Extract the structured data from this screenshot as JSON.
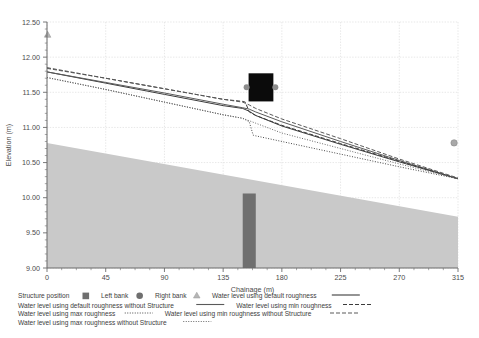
{
  "chart_data": {
    "type": "line",
    "title": "",
    "xlabel": "Chainage (m)",
    "ylabel": "Elevation (m)",
    "xlim": [
      0,
      315
    ],
    "ylim": [
      9.0,
      12.5
    ],
    "xticks": [
      0,
      45,
      90,
      135,
      180,
      225,
      270,
      315
    ],
    "yticks": [
      9.0,
      9.5,
      10.0,
      10.5,
      11.0,
      11.5,
      12.0,
      12.5
    ],
    "xtick_labels": [
      "0",
      "45",
      "90",
      "135",
      "180",
      "225",
      "270",
      "315"
    ],
    "ytick_labels": [
      "9.00",
      "9.50",
      "10.00",
      "10.50",
      "11.00",
      "11.50",
      "12.00",
      "12.50"
    ],
    "grid": true,
    "legend_position": "below-axes",
    "series": [
      {
        "name": "Water level using default roughness",
        "style": "solid",
        "color": "#3c3c3c",
        "x": [
          0,
          45,
          90,
          135,
          150,
          155,
          160,
          180,
          225,
          270,
          315
        ],
        "y": [
          11.79,
          11.63,
          11.47,
          11.31,
          11.27,
          11.23,
          11.17,
          11.02,
          10.76,
          10.51,
          10.27
        ]
      },
      {
        "name": "Water level using default roughness without Structure",
        "style": "solid",
        "color": "#5a5a5a",
        "x": [
          0,
          45,
          90,
          135,
          150,
          155,
          160,
          180,
          225,
          270,
          315
        ],
        "y": [
          11.79,
          11.64,
          11.49,
          11.33,
          11.28,
          11.26,
          11.22,
          11.08,
          10.8,
          10.53,
          10.27
        ]
      },
      {
        "name": "Water level using min roughness",
        "style": "dashed",
        "color": "#3c3c3c",
        "x": [
          0,
          45,
          90,
          135,
          150,
          152,
          155,
          160,
          180,
          225,
          270,
          315
        ],
        "y": [
          11.85,
          11.7,
          11.55,
          11.4,
          11.37,
          11.36,
          11.22,
          11.17,
          11.03,
          10.77,
          10.52,
          10.27
        ]
      },
      {
        "name": "Water level using min roughness without Structure",
        "style": "dashed",
        "color": "#5a5a5a",
        "x": [
          0,
          45,
          90,
          135,
          150,
          155,
          160,
          180,
          225,
          270,
          315
        ],
        "y": [
          11.84,
          11.7,
          11.55,
          11.4,
          11.36,
          11.32,
          11.27,
          11.12,
          10.84,
          10.55,
          10.28
        ]
      },
      {
        "name": "Water level using max roughness",
        "style": "dotted",
        "color": "#4a4a4a",
        "x": [
          0,
          45,
          90,
          135,
          150,
          155,
          158,
          160,
          180,
          225,
          270,
          315
        ],
        "y": [
          11.71,
          11.54,
          11.36,
          11.18,
          11.13,
          11.08,
          10.89,
          10.88,
          10.8,
          10.62,
          10.44,
          10.27
        ]
      },
      {
        "name": "Water level using max roughness without Structure",
        "style": "dotted",
        "color": "#6a6a6a",
        "x": [
          0,
          45,
          90,
          135,
          150,
          160,
          180,
          225,
          270,
          315
        ],
        "y": [
          11.71,
          11.54,
          11.36,
          11.18,
          11.13,
          11.06,
          10.92,
          10.7,
          10.48,
          10.27
        ]
      }
    ],
    "terrain": {
      "name": "Ground / bed profile",
      "fill_color": "#c9c9c9",
      "x": [
        0,
        315
      ],
      "y_top": [
        10.78,
        9.73
      ],
      "y_bottom": 9.0
    },
    "structure_position": {
      "name": "Structure position",
      "color": "#6f6f6f",
      "x_start": 150,
      "x_end": 160,
      "y_top": 10.06,
      "y_bottom": 9.0
    },
    "markers": [
      {
        "name": "Left bank",
        "shape": "triangle",
        "x": 0.5,
        "y": 12.32,
        "color": "#b5b5b5"
      },
      {
        "name": "Right bank",
        "shape": "circle",
        "x": 312,
        "y": 10.78,
        "color": "#a8a8a8"
      }
    ],
    "annotations": [
      {
        "name": "black-overlay-box",
        "x_center": 164,
        "y_center": 11.57,
        "width_x": 19,
        "height_y": 0.4,
        "color": "#0b0b0b"
      },
      {
        "name": "overlay-left-nub",
        "x_center": 153,
        "y_center": 11.57,
        "color": "#8d8d8d"
      },
      {
        "name": "overlay-right-nub",
        "x_center": 175,
        "y_center": 11.57,
        "color": "#8d8d8d"
      }
    ]
  },
  "axes": {
    "x_title": "Chainage (m)",
    "y_title": "Elevation (m)"
  },
  "legend": {
    "rows": [
      [
        {
          "label": "Structure position",
          "key": "swatch-square",
          "color": "#6f6f6f"
        },
        {
          "label": "Left bank",
          "key": "swatch-circle",
          "color": "#6f6f6f"
        },
        {
          "label": "Right bank",
          "key": "swatch-triangle",
          "color": "#b5b5b5"
        },
        {
          "label": "Water level using default roughness",
          "key": "line-solid",
          "color": "#3c3c3c"
        }
      ],
      [
        {
          "label": "Water level using default roughness without Structure",
          "key": "line-solid",
          "color": "#5a5a5a"
        },
        {
          "label": "Water level using min roughness",
          "key": "line-dashed",
          "color": "#3c3c3c"
        }
      ],
      [
        {
          "label": "Water level using max roughness",
          "key": "line-dotted",
          "color": "#4a4a4a"
        },
        {
          "label": "Water level using min roughness without Structure",
          "key": "line-dashed",
          "color": "#5a5a5a"
        }
      ],
      [
        {
          "label": "Water level using max roughness without Structure",
          "key": "line-dotted",
          "color": "#6a6a6a"
        }
      ]
    ]
  },
  "colors": {
    "terrain": "#c9c9c9",
    "structure": "#6f6f6f",
    "grid": "#dcdcdc",
    "axis": "#6b6b6b",
    "text": "#4a4a4a",
    "overlay": "#0b0b0b"
  }
}
